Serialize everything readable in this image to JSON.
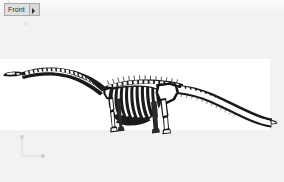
{
  "app": {
    "background_color": "#f2f2f2",
    "canvas_color": "#ffffff"
  },
  "toolbar": {
    "view_select": {
      "name": "view-selector",
      "value": "Front",
      "options": [
        "Front",
        "Back",
        "Left",
        "Right",
        "Top",
        "Bottom",
        "Perspective"
      ],
      "arrow_icon": "chevron-down-icon"
    }
  },
  "viewport": {
    "label": "3d-viewport",
    "model": {
      "name": "sauropod-dinosaur-skeleton",
      "description": "Lateral view of a long-necked sauropod dinosaur skeleton with whip tail",
      "line_color": "#1a1a1a",
      "fill_color": "#ffffff"
    }
  },
  "axis_gizmo": {
    "name": "axis-orientation-gizmo",
    "vertical_axis_label": "Z",
    "horizontal_axis_label": "X",
    "color": "#c9c9c9"
  }
}
